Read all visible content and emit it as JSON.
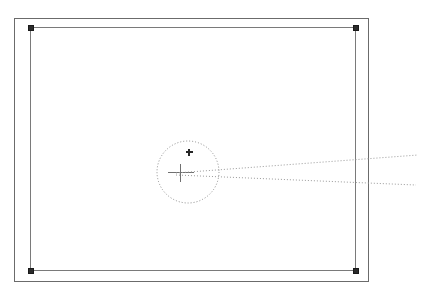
{
  "canvas": {
    "width": 429,
    "height": 300,
    "background_color": "#ffffff"
  },
  "colors": {
    "outer_frame_stroke": "#6b6b6b",
    "inner_frame_stroke": "#7a7a7a",
    "handle_fill": "#2b2b2b",
    "handle_stroke": "#1a1a1a",
    "dotted_stroke": "#8c8c8c",
    "crosshair_stroke": "#707070",
    "center_marker_fill": "#262626",
    "ray_stroke": "#9a9a9a"
  },
  "shapes": {
    "outer_frame": {
      "name": "outer-frame-rectangle",
      "x": 14,
      "y": 18,
      "width": 354,
      "height": 263,
      "stroke_width": 1
    },
    "inner_frame": {
      "name": "inner-selected-rectangle",
      "x": 30,
      "y": 27,
      "width": 325,
      "height": 243,
      "stroke_width": 1
    },
    "selection_handles": [
      {
        "name": "handle-top-left",
        "cx": 30,
        "cy": 27,
        "size": 5
      },
      {
        "name": "handle-top-right",
        "cx": 355,
        "cy": 27,
        "size": 5
      },
      {
        "name": "handle-bottom-left",
        "cx": 30,
        "cy": 270,
        "size": 5
      },
      {
        "name": "handle-bottom-right",
        "cx": 355,
        "cy": 270,
        "size": 5
      }
    ],
    "selection_circle": {
      "name": "dotted-selection-circle",
      "cx": 188,
      "cy": 172,
      "r": 31,
      "stroke_width": 1,
      "dash": "1 2"
    },
    "crosshair": {
      "name": "crosshair-marker",
      "cx": 180,
      "cy": 172,
      "arm_horizontal": 13,
      "arm_vertical": 9,
      "stroke_width": 1
    },
    "center_marker": {
      "name": "center-point-marker",
      "cx": 189,
      "cy": 152,
      "size": 7
    },
    "rays": [
      {
        "name": "ray-upper",
        "x1": 176,
        "y1": 173,
        "x2": 418,
        "y2": 155,
        "dash": "1 2",
        "stroke_width": 1
      },
      {
        "name": "ray-lower",
        "x1": 176,
        "y1": 175,
        "x2": 416,
        "y2": 185,
        "dash": "1 2",
        "stroke_width": 1
      }
    ],
    "vertex": {
      "name": "ray-vertex-point",
      "cx": 215,
      "cy": 172
    }
  }
}
